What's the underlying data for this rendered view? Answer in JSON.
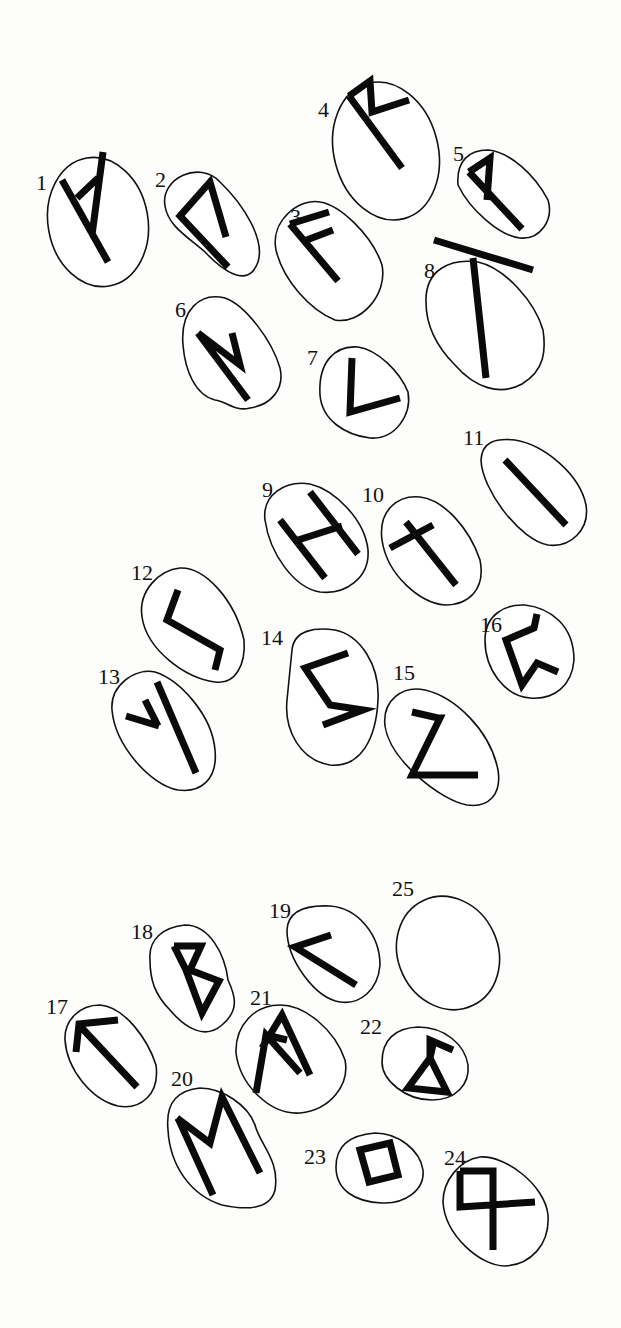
{
  "figure": {
    "stones": [
      {
        "number": "1",
        "rune": "Fehu",
        "label_pos": [
          38,
          190
        ],
        "cx": 98,
        "cy": 222,
        "rx": 50,
        "ry": 65,
        "rot": -10
      },
      {
        "number": "2",
        "rune": "Uruz",
        "label_pos": [
          154,
          186
        ],
        "cx": 215,
        "cy": 224,
        "rx": 48,
        "ry": 57,
        "rot": -30
      },
      {
        "number": "3",
        "rune": "Ansuz",
        "label_pos": [
          290,
          198
        ],
        "cx": 326,
        "cy": 262,
        "rx": 54,
        "ry": 72,
        "rot": -25
      },
      {
        "number": "4",
        "rune": "Raidho",
        "label_pos": [
          316,
          116
        ],
        "cx": 386,
        "cy": 151,
        "rx": 52,
        "ry": 70,
        "rot": -15
      },
      {
        "number": "5",
        "rune": "Wunjo",
        "label_pos": [
          453,
          160
        ],
        "cx": 502,
        "cy": 190,
        "rx": 44,
        "ry": 62,
        "rot": -25
      },
      {
        "number": "6",
        "rune": "Thurisaz",
        "label_pos": [
          173,
          316
        ],
        "cx": 232,
        "cy": 354,
        "rx": 46,
        "ry": 69,
        "rot": -20
      },
      {
        "number": "7",
        "rune": "Kenaz",
        "label_pos": [
          308,
          366
        ],
        "cx": 365,
        "cy": 386,
        "rx": 44,
        "ry": 60,
        "rot": -20
      },
      {
        "number": "8",
        "rune": "Gebo",
        "label_pos": [
          423,
          278
        ],
        "cx": 485,
        "cy": 330,
        "rx": 58,
        "ry": 76,
        "rot": -25
      },
      {
        "number": "9",
        "rune": "Hagalaz",
        "label_pos": [
          263,
          490
        ],
        "cx": 318,
        "cy": 537,
        "rx": 50,
        "ry": 66,
        "rot": -25
      },
      {
        "number": "10",
        "rune": "Nauthiz",
        "label_pos": [
          362,
          500
        ],
        "cx": 432,
        "cy": 548,
        "rx": 50,
        "ry": 68,
        "rot": -25
      },
      {
        "number": "11",
        "rune": "Isa",
        "label_pos": [
          464,
          446
        ],
        "cx": 535,
        "cy": 493,
        "rx": 50,
        "ry": 63,
        "rot": -40
      },
      {
        "number": "12",
        "rune": "Jera",
        "label_pos": [
          131,
          578
        ],
        "cx": 193,
        "cy": 624,
        "rx": 52,
        "ry": 60,
        "rot": -30
      },
      {
        "number": "13",
        "rune": "Algiz",
        "label_pos": [
          98,
          680
        ],
        "cx": 163,
        "cy": 731,
        "rx": 47,
        "ry": 60,
        "rot": -25
      },
      {
        "number": "14",
        "rune": "Sowilo",
        "label_pos": [
          261,
          642
        ],
        "cx": 334,
        "cy": 696,
        "rx": 45,
        "ry": 69,
        "rot": -10
      },
      {
        "number": "15",
        "rune": "Eihwaz",
        "label_pos": [
          392,
          678
        ],
        "cx": 441,
        "cy": 744,
        "rx": 47,
        "ry": 68,
        "rot": -35
      },
      {
        "number": "16",
        "rune": "Perthro",
        "label_pos": [
          480,
          630
        ],
        "cx": 528,
        "cy": 651,
        "rx": 45,
        "ry": 47,
        "rot": -10
      },
      {
        "number": "17",
        "rune": "Tiwaz",
        "label_pos": [
          47,
          1010
        ],
        "cx": 110,
        "cy": 1056,
        "rx": 46,
        "ry": 55,
        "rot": -20
      },
      {
        "number": "18",
        "rune": "Berkano",
        "label_pos": [
          131,
          935
        ],
        "cx": 194,
        "cy": 979,
        "rx": 42,
        "ry": 55,
        "rot": -20
      },
      {
        "number": "19",
        "rune": "Ehwaz",
        "label_pos": [
          267,
          913
        ],
        "cx": 332,
        "cy": 954,
        "rx": 46,
        "ry": 51,
        "rot": -20
      },
      {
        "number": "20",
        "rune": "Mannaz",
        "label_pos": [
          172,
          1085
        ],
        "cx": 223,
        "cy": 1148,
        "rx": 55,
        "ry": 64,
        "rot": -20
      },
      {
        "number": "21",
        "rune": "Laguz",
        "label_pos": [
          250,
          1001
        ],
        "cx": 290,
        "cy": 1060,
        "rx": 53,
        "ry": 58,
        "rot": -15
      },
      {
        "number": "22",
        "rune": "Ingwaz",
        "label_pos": [
          358,
          1025
        ],
        "cx": 424,
        "cy": 1061,
        "rx": 42,
        "ry": 46,
        "rot": -10
      },
      {
        "number": "23",
        "rune": "Dagaz",
        "label_pos": [
          301,
          1159
        ],
        "cx": 378,
        "cy": 1164,
        "rx": 46,
        "ry": 42,
        "rot": -10
      },
      {
        "number": "24",
        "rune": "Othala",
        "label_pos": [
          444,
          1159
        ],
        "cx": 490,
        "cy": 1222,
        "rx": 50,
        "ry": 58,
        "rot": -20
      },
      {
        "number": "25",
        "rune": "Blank",
        "label_pos": [
          392,
          893
        ],
        "cx": 447,
        "cy": 953,
        "rx": 50,
        "ry": 57,
        "rot": -20
      }
    ]
  }
}
